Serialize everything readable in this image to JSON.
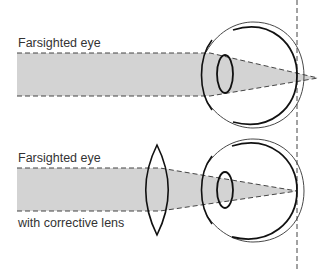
{
  "diagram": {
    "top_panel": {
      "label": "Farsighted eye",
      "description": "parallel light focuses behind the retina"
    },
    "bottom_panel": {
      "label_top": "Farsighted eye",
      "label_bottom": "with corrective lens",
      "description": "converging lens brings focus onto the retina"
    },
    "colors": {
      "beam_fill": "#d3d3d3",
      "line": "#222222",
      "text": "#333333"
    }
  }
}
